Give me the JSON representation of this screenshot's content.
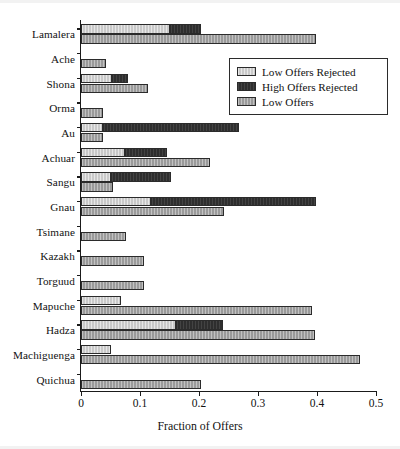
{
  "chart_data": {
    "type": "bar",
    "orientation": "horizontal",
    "stacked": true,
    "title": "",
    "xlabel": "Fraction of Offers",
    "ylabel": "",
    "xlim": [
      0,
      0.5
    ],
    "xticks": [
      "0",
      "0.1",
      "0.2",
      "0.3",
      "0.4",
      "0.5"
    ],
    "xtick_values": [
      0,
      0.1,
      0.2,
      0.3,
      0.4,
      0.5
    ],
    "grid": false,
    "legend_position": "upper right",
    "categories": [
      "Lamalera",
      "Ache",
      "Shona",
      "Orma",
      "Au",
      "Achuar",
      "Sangu",
      "Gnau",
      "Tsimane",
      "Kazakh",
      "Torguud",
      "Mapuche",
      "Hadza",
      "Machiguenga",
      "Quichua"
    ],
    "series": [
      {
        "name": "Low Offers Rejected",
        "color": "#c9c9c9",
        "values": [
          0.15,
          0.0,
          0.052,
          0.0,
          0.038,
          0.075,
          0.051,
          0.119,
          0.0,
          0.0,
          0.0,
          0.068,
          0.161,
          0.051,
          0.0
        ]
      },
      {
        "name": "High Offers Rejected",
        "color": "#2e2e2e",
        "values": [
          0.053,
          0.0,
          0.028,
          0.0,
          0.23,
          0.071,
          0.102,
          0.279,
          0.0,
          0.0,
          0.0,
          0.0,
          0.079,
          0.0,
          0.0
        ]
      },
      {
        "name": "Low Offers",
        "color": "#9a9a9a",
        "values": [
          0.398,
          0.042,
          0.113,
          0.038,
          0.038,
          0.219,
          0.055,
          0.242,
          0.076,
          0.107,
          0.106,
          0.392,
          0.396,
          0.473,
          0.203
        ]
      }
    ],
    "stack_totals_rejected": [
      0.203,
      0.0,
      0.08,
      0.0,
      0.268,
      0.146,
      0.153,
      0.398,
      0.0,
      0.0,
      0.0,
      0.068,
      0.24,
      0.051,
      0.0
    ]
  },
  "legend": {
    "items": [
      {
        "label": "Low Offers Rejected",
        "swatch": "light-gray-swatch"
      },
      {
        "label": "High Offers Rejected",
        "swatch": "dark-swatch"
      },
      {
        "label": "Low Offers",
        "swatch": "mid-gray-swatch"
      }
    ]
  },
  "axis": {
    "x_label": "Fraction of Offers"
  }
}
